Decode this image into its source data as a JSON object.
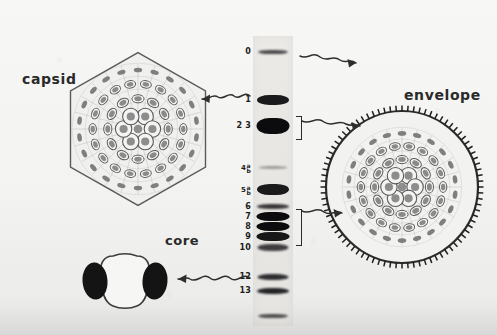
{
  "figure": {
    "labels": {
      "capsid": "capsid",
      "envelope": "envelope",
      "core": "core"
    },
    "colors": {
      "background": "#f3f3f1",
      "ink": "#2a2a2a",
      "band_dark": "#1a1a1a",
      "band_mid": "#3a3a3a",
      "capsomer_fill": "#8d8d8d",
      "outline": "#4a4a4a"
    }
  },
  "gel": {
    "name": "protein-band-lane",
    "bands": [
      {
        "id": "band-0",
        "label": "0",
        "top": 14,
        "height": 4,
        "width": 30,
        "darkness": 0.78,
        "blur": 1.1
      },
      {
        "id": "band-1",
        "label": "1",
        "top": 59,
        "height": 10,
        "width": 32,
        "darkness": 0.95,
        "blur": 0.7
      },
      {
        "id": "band-23",
        "label": "2 3",
        "top": 82,
        "height": 16,
        "width": 33,
        "darkness": 1.0,
        "blur": 0.7
      },
      {
        "id": "band-4",
        "label": "4",
        "sub": [
          "a",
          "b"
        ],
        "top": 130,
        "height": 3,
        "width": 29,
        "darkness": 0.42,
        "blur": 1.2
      },
      {
        "id": "band-5",
        "label": "5",
        "sub": [
          "a",
          "b"
        ],
        "top": 148,
        "height": 11,
        "width": 32,
        "darkness": 0.95,
        "blur": 0.6
      },
      {
        "id": "band-6",
        "label": "6",
        "top": 168,
        "height": 5,
        "width": 32,
        "darkness": 0.85,
        "blur": 0.8
      },
      {
        "id": "band-7",
        "label": "7",
        "top": 176,
        "height": 9,
        "width": 33,
        "darkness": 1.0,
        "blur": 0.6
      },
      {
        "id": "band-8",
        "label": "8",
        "top": 186,
        "height": 9,
        "width": 33,
        "darkness": 1.0,
        "blur": 0.6
      },
      {
        "id": "band-9",
        "label": "9",
        "top": 196,
        "height": 9,
        "width": 33,
        "darkness": 0.96,
        "blur": 0.7
      },
      {
        "id": "band-10",
        "label": "10",
        "top": 208,
        "height": 7,
        "width": 31,
        "darkness": 0.82,
        "blur": 1.2
      },
      {
        "id": "band-12",
        "label": "12",
        "top": 238,
        "height": 6,
        "width": 31,
        "darkness": 0.88,
        "blur": 0.8
      },
      {
        "id": "band-13",
        "label": "13",
        "top": 252,
        "height": 6,
        "width": 32,
        "darkness": 0.92,
        "blur": 0.8
      },
      {
        "id": "band-14",
        "label": "",
        "top": 278,
        "height": 4,
        "width": 30,
        "darkness": 0.75,
        "blur": 1.0
      }
    ],
    "brackets": [
      {
        "id": "bracket-23",
        "top": 80,
        "height": 22
      },
      {
        "id": "bracket-7to9",
        "top": 173,
        "height": 35
      }
    ]
  },
  "particles": {
    "capsid": {
      "name": "icosahedral-capsid-diagram",
      "capsomer_rings": [
        1,
        6,
        12,
        18
      ]
    },
    "envelope": {
      "name": "enveloped-virion-diagram",
      "spike_count": 84
    },
    "core": {
      "name": "viral-core-diagram",
      "lateral_bodies": 2
    }
  },
  "arrows": [
    {
      "id": "arrow-capsid",
      "from": "gel-band-1",
      "to": "capsid",
      "direction": "left"
    },
    {
      "id": "arrow-envelope-top",
      "from": "gel-band-0",
      "to": "envelope",
      "direction": "right"
    },
    {
      "id": "arrow-envelope-mid",
      "from": "gel-band-23",
      "to": "envelope",
      "direction": "right"
    },
    {
      "id": "arrow-envelope-low",
      "from": "gel-bands-7to9",
      "to": "envelope",
      "direction": "right"
    },
    {
      "id": "arrow-core",
      "from": "gel-band-13",
      "to": "core",
      "direction": "left"
    }
  ]
}
